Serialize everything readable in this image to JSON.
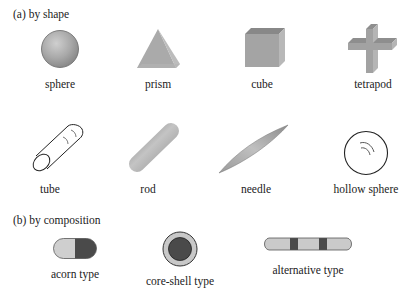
{
  "section_a": {
    "title": "(a) by shape",
    "items": [
      {
        "label": "sphere",
        "shape": "sphere"
      },
      {
        "label": "prism",
        "shape": "prism"
      },
      {
        "label": "cube",
        "shape": "cube"
      },
      {
        "label": "tetrapod",
        "shape": "tetrapod"
      },
      {
        "label": "tube",
        "shape": "tube"
      },
      {
        "label": "rod",
        "shape": "rod"
      },
      {
        "label": "needle",
        "shape": "needle"
      },
      {
        "label": "hollow sphere",
        "shape": "hollow-sphere"
      }
    ]
  },
  "section_b": {
    "title": "(b) by composition",
    "items": [
      {
        "label": "acorn type",
        "shape": "acorn"
      },
      {
        "label": "core-shell type",
        "shape": "core-shell"
      },
      {
        "label": "alternative type",
        "shape": "alternative"
      }
    ]
  },
  "colors": {
    "light_gray": "#c8c8c8",
    "mid_gray": "#a8a8a8",
    "dark_gray": "#4a4a4a",
    "outline": "#333333"
  }
}
